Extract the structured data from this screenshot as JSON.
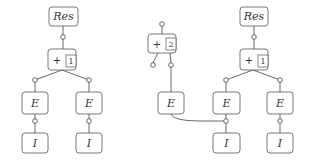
{
  "diagram": {
    "left_tree": {
      "root": {
        "label": "Res"
      },
      "plus": {
        "op": "+",
        "index": "1"
      },
      "children": [
        {
          "expr": "E",
          "leaf": "I"
        },
        {
          "expr": "E",
          "leaf": "I"
        }
      ]
    },
    "middle_fragment": {
      "plus": {
        "op": "+",
        "index": "2"
      },
      "expr": "E"
    },
    "right_tree": {
      "root": {
        "label": "Res"
      },
      "plus": {
        "op": "+",
        "index": "1"
      },
      "children": [
        {
          "expr": "E",
          "leaf": "I"
        },
        {
          "expr": "E",
          "leaf": "I"
        }
      ]
    }
  }
}
